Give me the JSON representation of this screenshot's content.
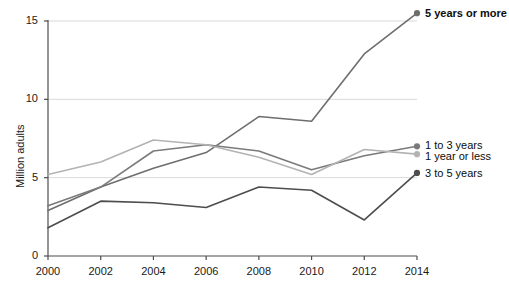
{
  "chart_data": {
    "type": "line",
    "title": "",
    "xlabel": "",
    "ylabel": "Million adults",
    "x": [
      2000,
      2002,
      2004,
      2006,
      2008,
      2010,
      2012,
      2014
    ],
    "xtick_labels": [
      "2000",
      "2002",
      "2004",
      "2006",
      "2008",
      "2010",
      "2012",
      "2014"
    ],
    "ytick_labels": [
      "0",
      "5",
      "10",
      "15"
    ],
    "yticks": [
      0,
      5,
      10,
      15
    ],
    "xlim": [
      2000,
      2014
    ],
    "ylim": [
      0,
      15
    ],
    "grid": "horizontal",
    "legend_position": "right-of-line-ends",
    "series": [
      {
        "name": "5 years or more",
        "color": "#6e6e6e",
        "emphasis": "bold",
        "values": [
          2.9,
          4.4,
          5.6,
          6.6,
          8.9,
          8.6,
          12.9,
          15.5
        ]
      },
      {
        "name": "1 to 3 years",
        "color": "#7a7a7a",
        "emphasis": "normal",
        "values": [
          3.2,
          4.4,
          6.7,
          7.1,
          6.7,
          5.5,
          6.4,
          7.0
        ]
      },
      {
        "name": "1 year or less",
        "color": "#b3b3b3",
        "emphasis": "normal",
        "values": [
          5.2,
          6.0,
          7.4,
          7.1,
          6.3,
          5.2,
          6.8,
          6.5
        ]
      },
      {
        "name": "3 to 5 years",
        "color": "#4d4d4d",
        "emphasis": "normal",
        "values": [
          1.8,
          3.5,
          3.4,
          3.1,
          4.4,
          4.2,
          2.3,
          5.3
        ]
      }
    ]
  },
  "axes": {
    "y_title": "Million adults",
    "y_ticks": [
      "15",
      "10",
      "5",
      "0"
    ],
    "x_ticks": [
      "2000",
      "2002",
      "2004",
      "2006",
      "2008",
      "2010",
      "2012",
      "2014"
    ]
  },
  "legend": {
    "items": [
      {
        "label": "5 years or more"
      },
      {
        "label": "1 to 3 years"
      },
      {
        "label": "1 year or less"
      },
      {
        "label": "3 to 5 years"
      }
    ]
  },
  "colors": {
    "gridline": "#d9d9d9",
    "axis": "#4d4d4d",
    "background": "#ffffff",
    "text": "#1a1a1a"
  }
}
